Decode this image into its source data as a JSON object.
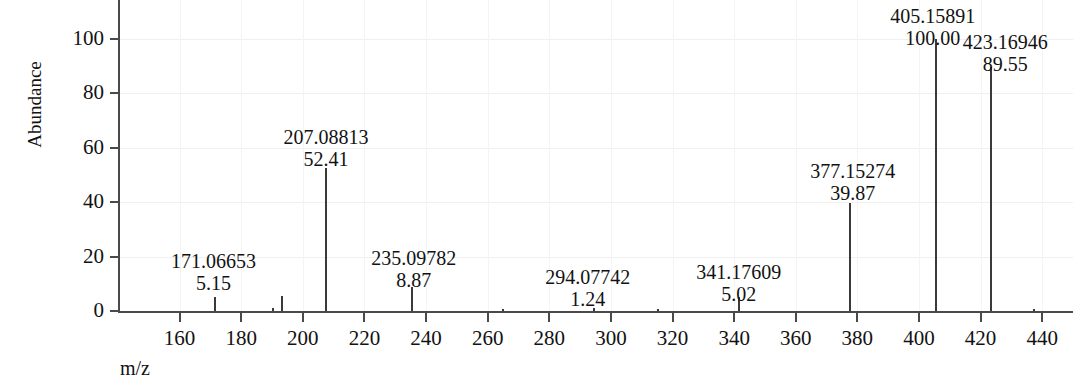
{
  "chart_data": {
    "type": "bar",
    "title": "",
    "subtitle": "",
    "xlabel": "m/z",
    "ylabel": "Abundance",
    "xlim": [
      140,
      450
    ],
    "ylim": [
      0,
      108
    ],
    "grid": true,
    "legend": null,
    "x_ticks": [
      160,
      180,
      200,
      220,
      240,
      260,
      280,
      300,
      320,
      340,
      360,
      380,
      400,
      420,
      440
    ],
    "y_ticks": [
      0,
      20,
      40,
      60,
      80,
      100
    ],
    "x_tick_labels": [
      "160",
      "180",
      "200",
      "220",
      "240",
      "260",
      "280",
      "300",
      "320",
      "340",
      "360",
      "380",
      "400",
      "420",
      "440"
    ],
    "y_tick_labels": [
      "0",
      "20",
      "40",
      "60",
      "80",
      "100"
    ],
    "labeled_peaks": [
      {
        "mz": 171.06653,
        "abundance": 5.15,
        "mz_text": "171.06653",
        "ab_text": "5.15",
        "label_x": 171.0,
        "label_y": 22.5
      },
      {
        "mz": 207.08813,
        "abundance": 52.41,
        "mz_text": "207.08813",
        "ab_text": "52.41",
        "label_x": 207.5,
        "label_y": 68.0
      },
      {
        "mz": 235.09782,
        "abundance": 8.87,
        "mz_text": "235.09782",
        "ab_text": "8.87",
        "label_x": 236.0,
        "label_y": 23.5
      },
      {
        "mz": 294.07742,
        "abundance": 1.24,
        "mz_text": "294.07742",
        "ab_text": "1.24",
        "label_x": 292.5,
        "label_y": 16.5
      },
      {
        "mz": 341.17609,
        "abundance": 5.02,
        "mz_text": "341.17609",
        "ab_text": "5.02",
        "label_x": 341.5,
        "label_y": 18.5
      },
      {
        "mz": 377.15274,
        "abundance": 39.87,
        "mz_text": "377.15274",
        "ab_text": "39.87",
        "label_x": 378.5,
        "label_y": 55.5
      },
      {
        "mz": 405.15891,
        "abundance": 100.0,
        "mz_text": "405.15891",
        "ab_text": "100.00",
        "label_x": 404.5,
        "label_y": 112.5
      },
      {
        "mz": 423.16946,
        "abundance": 89.55,
        "mz_text": "423.16946",
        "ab_text": "89.55",
        "label_x": 428.0,
        "label_y": 103.0
      }
    ],
    "unlabeled_peaks": [
      {
        "mz": 190.0,
        "abundance": 1.1
      },
      {
        "mz": 193.0,
        "abundance": 5.6
      },
      {
        "mz": 264.5,
        "abundance": 0.7
      },
      {
        "mz": 315.0,
        "abundance": 0.8
      },
      {
        "mz": 437.0,
        "abundance": 0.8
      }
    ]
  }
}
